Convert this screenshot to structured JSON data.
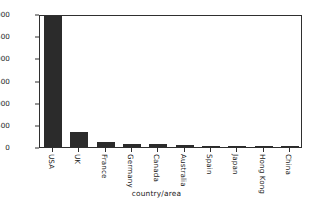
{
  "chart_data": {
    "type": "bar",
    "title": "",
    "xlabel": "country/area",
    "ylabel": "",
    "categories": [
      "USA",
      "UK",
      "France",
      "Germany",
      "Canada",
      "Australia",
      "Spain",
      "Japan",
      "Hong Kong",
      "China"
    ],
    "values": [
      2960,
      330,
      110,
      75,
      60,
      50,
      10,
      8,
      5,
      3
    ],
    "ylim": [
      0,
      3000
    ],
    "yticks": [
      0,
      500,
      1000,
      1500,
      2000,
      2500,
      3000
    ],
    "ytick_labels": [
      "0",
      "500",
      "1000",
      "1500",
      "2000",
      "2500",
      "3000"
    ],
    "grid": false,
    "legend": null,
    "bar_color": "#2b2b2b",
    "axes_color": "#2f2f2f",
    "background": "#ffffff",
    "xtick_rotation": 90
  }
}
